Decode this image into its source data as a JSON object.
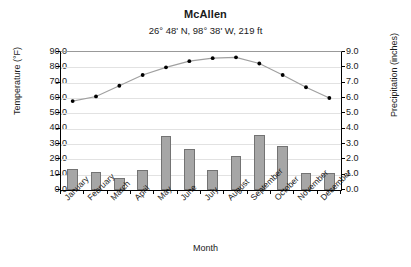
{
  "chart_data": {
    "type": "bar",
    "title": "McAllen",
    "subtitle": "26° 48' N, 98° 38' W, 219 ft",
    "xlabel": "Month",
    "ylabel": "Temperature (°F)",
    "y2label": "Precipitation (inches)",
    "ylim": [
      0,
      90
    ],
    "y2lim": [
      0,
      9
    ],
    "grid": true,
    "legend": "none",
    "categories": [
      "January",
      "February",
      "March",
      "April",
      "May",
      "June",
      "July",
      "August",
      "September",
      "October",
      "November",
      "December"
    ],
    "y_ticks": [
      "0.0",
      "10.0",
      "20.0",
      "30.0",
      "40.0",
      "50.0",
      "60.0",
      "70.0",
      "80.0",
      "90.0"
    ],
    "y2_ticks": [
      "0.0",
      "1.0",
      "2.0",
      "3.0",
      "4.0",
      "5.0",
      "6.0",
      "7.0",
      "8.0",
      "9.0"
    ],
    "series": [
      {
        "name": "Precipitation (inches)",
        "type": "bar",
        "axis": "right",
        "color": "#a6a6a6",
        "edge_color": "#737373",
        "values": [
          1.4,
          1.2,
          0.8,
          1.3,
          3.5,
          2.7,
          1.3,
          2.2,
          3.6,
          2.9,
          1.1,
          1.1
        ]
      },
      {
        "name": "Temperature (°F)",
        "type": "line",
        "axis": "left",
        "color": "#a0a0a0",
        "marker_color": "#000000",
        "values": [
          58.0,
          61.0,
          68.0,
          75.0,
          80.0,
          84.0,
          86.0,
          86.5,
          82.5,
          75.0,
          67.0,
          60.0
        ]
      }
    ]
  }
}
